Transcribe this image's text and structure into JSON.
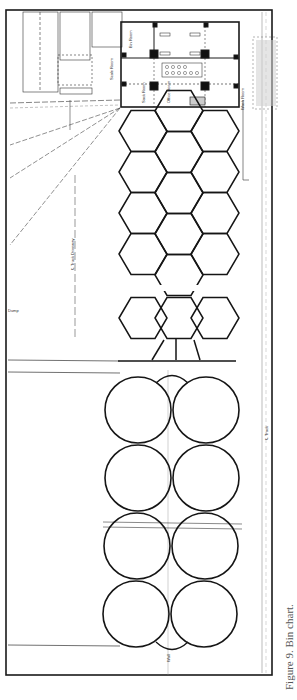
{
  "figure": {
    "caption": "Figure 9. Bin chart.",
    "type": "architectural plan drawing (rotated 90°)"
  },
  "labels": {
    "building_rooms": [
      "Bin Room",
      "Sack Room",
      "Office Room",
      "Scale Room",
      "Motor Room",
      "Wash Room"
    ],
    "track_centerline": "℄ Track",
    "truck_centerline": "℄ Truck Driveway",
    "dashed_lines": [
      "Property line",
      "Track line offset",
      "Track curve"
    ],
    "left_annotation": "Dump",
    "bottom_annotation": "Wall"
  },
  "structure": {
    "hex_bins": {
      "rows": 6,
      "columns": 3,
      "layout": "honeycomb"
    },
    "round_tanks": {
      "count": 8,
      "rows": 4,
      "columns": 2
    }
  },
  "colors": {
    "ink": "#1a1a1a",
    "paper": "#ffffff",
    "faint": "#888888"
  }
}
